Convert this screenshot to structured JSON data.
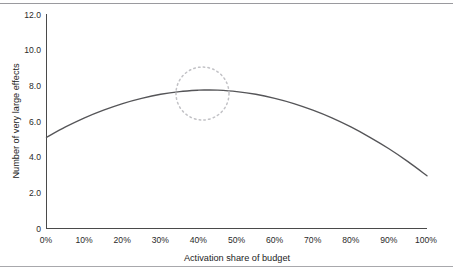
{
  "chart_data": {
    "type": "line",
    "title": "",
    "subtitle": "",
    "xlabel": "Activation share of budget",
    "ylabel": "Number of very large effects",
    "xlim": [
      0,
      100
    ],
    "ylim": [
      0,
      12
    ],
    "grid": false,
    "legend": null,
    "x_ticks": [
      "0%",
      "10%",
      "20%",
      "30%",
      "40%",
      "50%",
      "60%",
      "70%",
      "80%",
      "90%",
      "100%"
    ],
    "y_ticks": [
      "0",
      "2.0",
      "4.0",
      "6.0",
      "8.0",
      "10.0",
      "12.0"
    ],
    "x_tick_values": [
      0,
      10,
      20,
      30,
      40,
      50,
      60,
      70,
      80,
      90,
      100
    ],
    "y_tick_values": [
      0,
      2,
      4,
      6,
      8,
      10,
      12
    ],
    "series": [
      {
        "name": "Number of very large effects",
        "color": "#555558",
        "x": [
          0,
          5,
          10,
          15,
          20,
          25,
          30,
          35,
          40,
          42,
          45,
          50,
          55,
          60,
          65,
          70,
          75,
          80,
          85,
          90,
          95,
          100
        ],
        "values": [
          5.1,
          5.68,
          6.19,
          6.62,
          6.99,
          7.28,
          7.51,
          7.66,
          7.74,
          7.75,
          7.74,
          7.66,
          7.51,
          7.28,
          6.99,
          6.62,
          6.19,
          5.68,
          5.1,
          4.46,
          3.74,
          2.95
        ]
      }
    ],
    "annotations": [
      {
        "type": "circle",
        "style": "dotted",
        "color": "#c2c2c6",
        "center_x": 41,
        "center_y": 7.55,
        "label": ""
      }
    ]
  },
  "axes": {
    "x_axis_title": "Activation share of budget",
    "y_axis_title": "Number of very large effects"
  }
}
